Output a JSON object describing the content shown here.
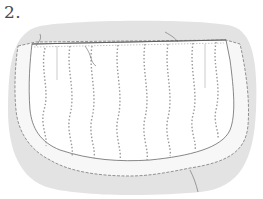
{
  "step": {
    "label": "2."
  },
  "illustration": {
    "subject": "apron-with-ruffle",
    "background_color": "#e3e3e3",
    "fabric_color": "#ffffff",
    "line_color": "#6a6a6a",
    "stripe_color": "#9a9a9a",
    "stripe_count": 8
  }
}
